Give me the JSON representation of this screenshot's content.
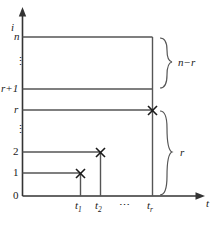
{
  "figure": {
    "axes": {
      "y_axis_label": "i",
      "x_axis_label": "t",
      "origin_label": "0"
    },
    "colors": {
      "line": "#555555",
      "axis": "#333333",
      "marker": "#1a1a1a",
      "text": "#1a1a1a",
      "background": "#ffffff"
    },
    "y_ticks": [
      {
        "label": "0",
        "y": 196
      },
      {
        "label": "1",
        "y": 173
      },
      {
        "label": "2",
        "y": 152
      },
      {
        "label": "⋮",
        "y": 130,
        "is_ellipsis": true
      },
      {
        "label": "r",
        "y": 110
      },
      {
        "label": "r+1",
        "y": 89
      },
      {
        "label": "⋮",
        "y": 62,
        "is_ellipsis": true
      },
      {
        "label": "n",
        "y": 37
      }
    ],
    "x_ticks": [
      {
        "label": "t",
        "sub": "1",
        "x": 80
      },
      {
        "label": "t",
        "sub": "2",
        "x": 100
      },
      {
        "label": "⋯",
        "x": 126,
        "is_ellipsis": true
      },
      {
        "label": "t",
        "sub": "r",
        "x": 152
      }
    ],
    "markers": [
      {
        "glyph": "✕",
        "x": 80,
        "y": 173,
        "at": "(t1, 1)"
      },
      {
        "glyph": "✕",
        "x": 100,
        "y": 152,
        "at": "(t2, 2)"
      },
      {
        "glyph": "✕",
        "x": 152,
        "y": 110,
        "at": "(tr, r)"
      }
    ],
    "braces": [
      {
        "label": "n−r",
        "span_from": "r+1",
        "span_to": "n",
        "label_x": 189,
        "label_y": 63
      },
      {
        "label": "r",
        "span_from": "0",
        "span_to": "r",
        "label_x": 189,
        "label_y": 153
      }
    ]
  }
}
